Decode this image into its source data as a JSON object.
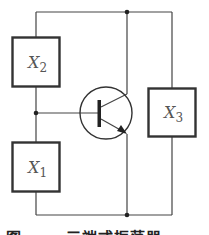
{
  "diagram": {
    "type": "three-terminal oscillator circuit",
    "components": [
      {
        "id": "X2",
        "label": "X",
        "subscript": "2"
      },
      {
        "id": "X1",
        "label": "X",
        "subscript": "1"
      },
      {
        "id": "X3",
        "label": "X",
        "subscript": "3"
      }
    ],
    "transistor": {
      "type": "NPN",
      "terminals": [
        "base",
        "collector",
        "emitter"
      ]
    },
    "caption": "图 ——  三端式振荡器"
  },
  "colors": {
    "line": "#333333",
    "background": "#ffffff"
  }
}
